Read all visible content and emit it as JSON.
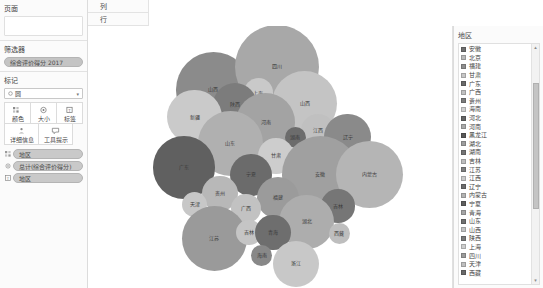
{
  "sidebar": {
    "pages": {
      "title": "页面"
    },
    "filters": {
      "title": "筛选器",
      "pills": [
        {
          "label": "综合评价得分 2017",
          "icon": "filter-pill"
        }
      ]
    },
    "marks": {
      "title": "标记",
      "mark_type": "圆",
      "mark_type_icon": "circle-icon",
      "caret": "▾",
      "buttons": [
        {
          "label": "颜色",
          "icon": "color-icon"
        },
        {
          "label": "大小",
          "icon": "size-icon"
        },
        {
          "label": "标签",
          "icon": "label-icon"
        },
        {
          "label": "详细信息",
          "icon": "detail-icon"
        },
        {
          "label": "工具提示",
          "icon": "tooltip-icon"
        }
      ],
      "pills": [
        {
          "label": "地区",
          "icon": "color-pill-icon",
          "color": "#c9c9c9"
        },
        {
          "label": "总计(综合评价得分)",
          "icon": "size-pill-icon",
          "color": "#c9c9c9"
        },
        {
          "label": "地区",
          "icon": "label-pill-icon",
          "color": "#c9c9c9"
        }
      ]
    }
  },
  "shelves": [
    {
      "label": "列",
      "icon": "grip-icon"
    },
    {
      "label": "行",
      "icon": "grip-icon"
    }
  ],
  "legend": {
    "title": "地区",
    "scroll_up": "▴",
    "scroll_down": "▾",
    "items": [
      {
        "label": "安徽",
        "color": "#6f6f6f"
      },
      {
        "label": "北京",
        "color": "#b9b9b9"
      },
      {
        "label": "福建",
        "color": "#8e8e8e"
      },
      {
        "label": "甘肃",
        "color": "#c6c6c6"
      },
      {
        "label": "广东",
        "color": "#6a6a6a"
      },
      {
        "label": "广西",
        "color": "#c0c0c0"
      },
      {
        "label": "贵州",
        "color": "#7b7b7b"
      },
      {
        "label": "海南",
        "color": "#cfcfcf"
      },
      {
        "label": "河北",
        "color": "#656565"
      },
      {
        "label": "河南",
        "color": "#a9a9a9"
      },
      {
        "label": "黑龙江",
        "color": "#585858"
      },
      {
        "label": "湖北",
        "color": "#9d9d9d"
      },
      {
        "label": "湖南",
        "color": "#747474"
      },
      {
        "label": "吉林",
        "color": "#bdbdbd"
      },
      {
        "label": "江苏",
        "color": "#7f7f7f"
      },
      {
        "label": "江西",
        "color": "#cacaca"
      },
      {
        "label": "辽宁",
        "color": "#6d6d6d"
      },
      {
        "label": "内蒙古",
        "color": "#b2b2b2"
      },
      {
        "label": "宁夏",
        "color": "#5f5f5f"
      },
      {
        "label": "青海",
        "color": "#a5a5a5"
      },
      {
        "label": "山东",
        "color": "#707070"
      },
      {
        "label": "山西",
        "color": "#c3c3c3"
      },
      {
        "label": "陕西",
        "color": "#7a7a7a"
      },
      {
        "label": "上海",
        "color": "#cdcdcd"
      },
      {
        "label": "四川",
        "color": "#9b9b9b"
      },
      {
        "label": "天津",
        "color": "#bfbfbf"
      },
      {
        "label": "西藏",
        "color": "#696969"
      }
    ]
  },
  "chart_data": {
    "type": "bubble",
    "title": "",
    "xlabel": "",
    "ylabel": "",
    "color_field": "地区",
    "size_field": "总计(综合评价得分)",
    "label_field": "地区",
    "bubbles": [
      {
        "label": "山西",
        "cx": 57,
        "cy": 61,
        "r": 36,
        "color": "#8b8b8b"
      },
      {
        "label": "四川",
        "cx": 118,
        "cy": 39,
        "r": 40,
        "color": "#a8a8a8"
      },
      {
        "label": "上海",
        "cx": 100,
        "cy": 64,
        "r": 14,
        "color": "#c9c9c9"
      },
      {
        "label": "陕西",
        "cx": 78,
        "cy": 75,
        "r": 21,
        "color": "#7c7c7c"
      },
      {
        "label": "山西2",
        "cx": 144,
        "cy": 74,
        "r": 31,
        "color": "#c4c4c4"
      },
      {
        "label": "新疆",
        "cx": 39,
        "cy": 87,
        "r": 26,
        "color": "#cacaca"
      },
      {
        "label": "河南",
        "cx": 107,
        "cy": 92,
        "r": 28,
        "color": "#a3a3a3"
      },
      {
        "label": "江西",
        "cx": 157,
        "cy": 100,
        "r": 16,
        "color": "#c0c0c0"
      },
      {
        "label": "辽宁",
        "cx": 185,
        "cy": 106,
        "r": 22,
        "color": "#8a8a8a"
      },
      {
        "label": "湖南",
        "cx": 135,
        "cy": 106,
        "r": 10,
        "color": "#6c6c6c"
      },
      {
        "label": "山东",
        "cx": 73,
        "cy": 112,
        "r": 31,
        "color": "#b0b0b0"
      },
      {
        "label": "甘肃",
        "cx": 117,
        "cy": 124,
        "r": 17,
        "color": "#cdcdcd"
      },
      {
        "label": "广东",
        "cx": 29,
        "cy": 135,
        "r": 30,
        "color": "#606060"
      },
      {
        "label": "安徽",
        "cx": 159,
        "cy": 142,
        "r": 37,
        "color": "#a0a0a0"
      },
      {
        "label": "内蒙古",
        "cx": 206,
        "cy": 142,
        "r": 32,
        "color": "#b5b5b5"
      },
      {
        "label": "宁夏",
        "cx": 93,
        "cy": 142,
        "r": 20,
        "color": "#6b6b6b"
      },
      {
        "label": "贵州",
        "cx": 63,
        "cy": 160,
        "r": 17,
        "color": "#b8b8b8"
      },
      {
        "label": "福建",
        "cx": 119,
        "cy": 164,
        "r": 20,
        "color": "#9b9b9b"
      },
      {
        "label": "天津",
        "cx": 39,
        "cy": 170,
        "r": 12,
        "color": "#c7c7c7"
      },
      {
        "label": "广西",
        "cx": 88,
        "cy": 174,
        "r": 14,
        "color": "#c2c2c2"
      },
      {
        "label": "吉林",
        "cx": 176,
        "cy": 172,
        "r": 16,
        "color": "#767676"
      },
      {
        "label": "湖北",
        "cx": 146,
        "cy": 187,
        "r": 26,
        "color": "#adadad"
      },
      {
        "label": "江苏",
        "cx": 58,
        "cy": 203,
        "r": 31,
        "color": "#9a9a9a"
      },
      {
        "label": "吉林2",
        "cx": 91,
        "cy": 197,
        "r": 12,
        "color": "#c5c5c5"
      },
      {
        "label": "青海",
        "cx": 114,
        "cy": 197,
        "r": 17,
        "color": "#6e6e6e"
      },
      {
        "label": "海南",
        "cx": 103,
        "cy": 219,
        "r": 10,
        "color": "#888888"
      },
      {
        "label": "浙江",
        "cx": 136,
        "cy": 227,
        "r": 22,
        "color": "#c8c8c8"
      },
      {
        "label": "西藏",
        "cx": 177,
        "cy": 198,
        "r": 10,
        "color": "#bebebe"
      }
    ]
  }
}
